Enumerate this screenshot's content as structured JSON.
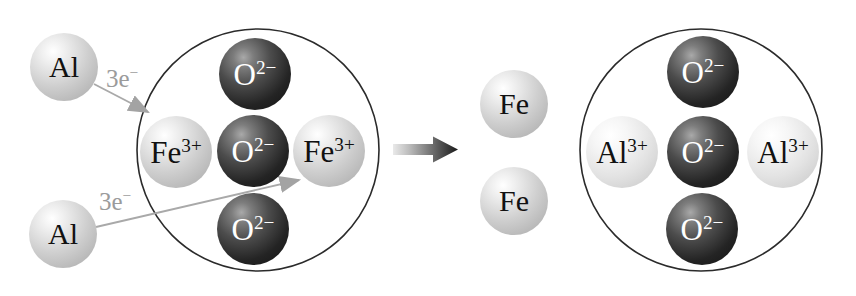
{
  "reactants": {
    "aluminum_atoms": [
      {
        "base": "Al"
      },
      {
        "base": "Al"
      }
    ],
    "electron_transfer_labels": [
      {
        "base": "3e",
        "sup": "−"
      },
      {
        "base": "3e",
        "sup": "−"
      }
    ],
    "iron_oxide_lattice": {
      "top_oxide": {
        "base": "O",
        "sup": "2−"
      },
      "left_iron_ion": {
        "base": "Fe",
        "sup": "3+"
      },
      "center_oxide": {
        "base": "O",
        "sup": "2−"
      },
      "right_iron_ion": {
        "base": "Fe",
        "sup": "3+"
      },
      "bottom_oxide": {
        "base": "O",
        "sup": "2−"
      }
    }
  },
  "products": {
    "iron_atoms": [
      {
        "base": "Fe"
      },
      {
        "base": "Fe"
      }
    ],
    "aluminum_oxide_lattice": {
      "top_oxide": {
        "base": "O",
        "sup": "2−"
      },
      "left_aluminum_ion": {
        "base": "Al",
        "sup": "3+"
      },
      "center_oxide": {
        "base": "O",
        "sup": "2−"
      },
      "right_aluminum_ion": {
        "base": "Al",
        "sup": "3+"
      },
      "bottom_oxide": {
        "base": "O",
        "sup": "2−"
      }
    }
  },
  "colors": {
    "oxide_ion_dark": "#141414",
    "metal_sphere_light": "#c0c0c0",
    "aluminum_ion_lighter": "#dadada",
    "electron_arrow_gray": "#a3a3a3",
    "electron_label_gray": "#9b9b9b",
    "lattice_outline": "#2b2b2b",
    "reaction_arrow_dark": "#161616",
    "background": "#ffffff"
  }
}
